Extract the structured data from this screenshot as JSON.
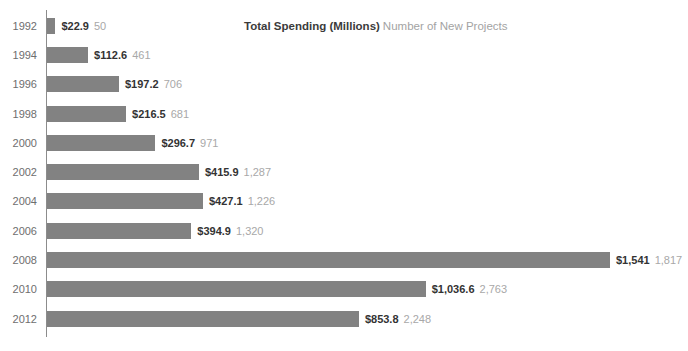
{
  "title": {
    "spending": "Total Spending (Millions)",
    "projects": "Number of New Projects"
  },
  "chart_data": {
    "type": "bar",
    "orientation": "horizontal",
    "categories": [
      "1992",
      "1994",
      "1996",
      "1998",
      "2000",
      "2002",
      "2004",
      "2006",
      "2008",
      "2010",
      "2012"
    ],
    "series": [
      {
        "name": "Total Spending (Millions)",
        "values": [
          22.9,
          112.6,
          197.2,
          216.5,
          296.7,
          415.9,
          427.1,
          394.9,
          1541,
          1036.6,
          853.8
        ],
        "labels": [
          "$22.9",
          "$112.6",
          "$197.2",
          "$216.5",
          "$296.7",
          "$415.9",
          "$427.1",
          "$394.9",
          "$1,541",
          "$1,036.6",
          "$853.8"
        ]
      },
      {
        "name": "Number of New Projects",
        "values": [
          50,
          461,
          706,
          681,
          971,
          1287,
          1226,
          1320,
          1817,
          2763,
          2248
        ],
        "labels": [
          "50",
          "461",
          "706",
          "681",
          "971",
          "1,287",
          "1,226",
          "1,320",
          "1,817",
          "2,763",
          "2,248"
        ]
      }
    ],
    "bar_scale_max": 1541,
    "bar_max_px": 563,
    "xlabel": "",
    "ylabel": "",
    "grid": false,
    "legend_position": "top-center",
    "colors": {
      "bar": "#828282",
      "spending_label": "#333333",
      "projects_label": "#a8a8a8",
      "year_label": "#6e6e6e",
      "axis": "#8c8c8c",
      "legend_spending": "#3b3b3b",
      "legend_projects": "#a3a3a3"
    }
  }
}
